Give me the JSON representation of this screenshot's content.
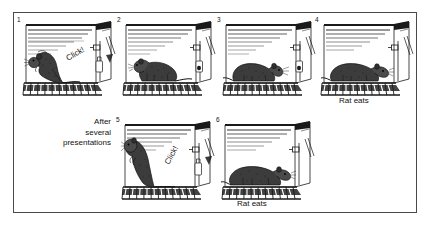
{
  "figure": {
    "title_visible": false,
    "background_color": "#ffffff",
    "frame_color": "#4a4a4a",
    "ink_color": "#111111",
    "style": "black-and-white stippled line drawing"
  },
  "note": {
    "line1": "After",
    "line2": "several",
    "line3": "presentations"
  },
  "panels": [
    {
      "number": "1",
      "row": 1,
      "rat_pose": "rearing-up-facing-left",
      "sound_label": "Click!",
      "dispenser_label": "Pellet falls",
      "caption": "",
      "food_in_tray": false
    },
    {
      "number": "2",
      "row": 1,
      "rat_pose": "standing-turning-head-left",
      "sound_label": "",
      "dispenser_label": "",
      "caption": "",
      "food_in_tray": true
    },
    {
      "number": "3",
      "row": 1,
      "rat_pose": "crouched-facing-right",
      "sound_label": "",
      "dispenser_label": "",
      "caption": "",
      "food_in_tray": true
    },
    {
      "number": "4",
      "row": 1,
      "rat_pose": "head-at-food-tray",
      "sound_label": "",
      "dispenser_label": "",
      "caption": "Rat eats",
      "food_in_tray": true
    },
    {
      "number": "5",
      "row": 2,
      "rat_pose": "rearing-up-high-facing-left",
      "sound_label": "Click!",
      "dispenser_label": "Pellet falls",
      "caption": "",
      "food_in_tray": true
    },
    {
      "number": "6",
      "row": 2,
      "rat_pose": "head-at-food-tray",
      "sound_label": "",
      "dispenser_label": "",
      "caption": "Rat eats",
      "food_in_tray": true
    }
  ]
}
